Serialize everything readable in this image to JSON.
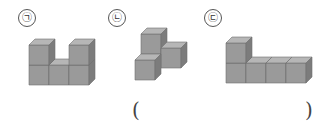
{
  "figures": [
    {
      "label": "㉠",
      "description": "U-shaped stack: 2 columns of 2 cubes with a single cube between them"
    },
    {
      "label": "㉡",
      "description": "L-tromino-like stack: one cube on top, two cubes below forming an L"
    },
    {
      "label": "㉢",
      "description": "Stack of one column of 2 cubes with 3 cubes extending right in a row"
    }
  ],
  "answer": {
    "open": "(",
    "close": ")",
    "value": ""
  },
  "colors": {
    "front": "#9a9a9a",
    "top": "#b8b8b8",
    "side": "#7e7e7e",
    "edge": "#6a6a6a"
  }
}
